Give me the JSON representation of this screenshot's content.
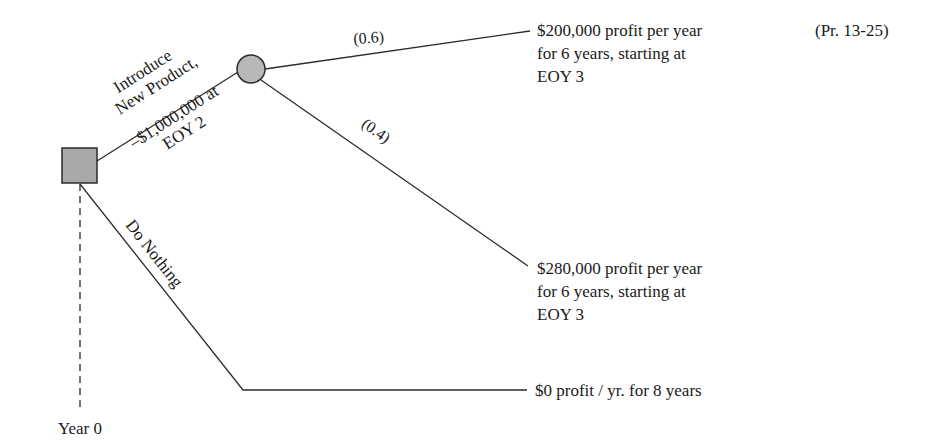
{
  "problem_ref": "(Pr. 13-25)",
  "decision_node": {
    "shape": "square",
    "fill": "#a8a8a8"
  },
  "chance_node": {
    "shape": "circle",
    "fill": "#b8b8b8"
  },
  "branches": {
    "introduce": {
      "line1": "Introduce",
      "line2": "New Product,",
      "line3": "–$1,000,000 at",
      "line4": "EOY 2"
    },
    "do_nothing": {
      "label": "Do Nothing"
    }
  },
  "probabilities": {
    "high": "(0.6)",
    "low": "(0.4)"
  },
  "outcomes": {
    "high": {
      "line1": "$200,000 profit per year",
      "line2": "for 6 years, starting at",
      "line3": "EOY 3"
    },
    "low": {
      "line1": "$280,000 profit per year",
      "line2": "for 6 years, starting at",
      "line3": "EOY 3"
    },
    "nothing": {
      "line1": "$0 profit / yr. for 8 years"
    }
  },
  "timeline": {
    "label": "Year 0"
  }
}
